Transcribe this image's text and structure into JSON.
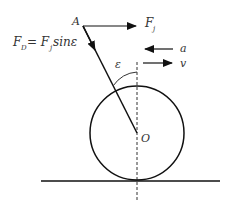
{
  "diagram": {
    "labels": {
      "point_a": "A",
      "force_fj": "F",
      "force_fj_sub": "j",
      "formula_lhs": "F",
      "formula_lhs_sub": "D",
      "formula_eq": "= F",
      "formula_rhs_sub": "j",
      "formula_tail": " sinε",
      "accel": "a",
      "velocity": "v",
      "angle": "ε",
      "center": "O"
    },
    "colors": {
      "stroke": "#111111",
      "text": "#333333"
    }
  }
}
